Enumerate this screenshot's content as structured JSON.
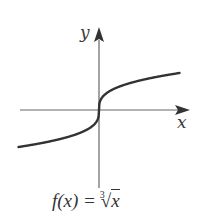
{
  "chart_data": {
    "type": "line",
    "title": "",
    "caption": "f(x) = ∛x",
    "xlabel": "x",
    "ylabel": "y",
    "series": [
      {
        "name": "f(x) = cube root of x",
        "function": "cbrt(x)",
        "x": [
          -8,
          -6,
          -4,
          -2,
          -1,
          -0.5,
          -0.125,
          0,
          0.125,
          0.5,
          1,
          2,
          4,
          6,
          8
        ],
        "values": [
          -2,
          -1.817,
          -1.587,
          -1.26,
          -1,
          -0.794,
          -0.5,
          0,
          0.5,
          0.794,
          1,
          1.26,
          1.587,
          1.817,
          2
        ]
      }
    ],
    "xlim": [
      -8,
      8
    ],
    "ylim": [
      -5,
      5
    ],
    "grid": false,
    "ticks": false,
    "legend": null,
    "colors": {
      "axis": "#555555",
      "curve": "#333333"
    }
  },
  "labels": {
    "x_axis": "x",
    "y_axis": "y",
    "caption_prefix": "f(x) = ",
    "caption_index": "3",
    "caption_radicand": "x"
  }
}
